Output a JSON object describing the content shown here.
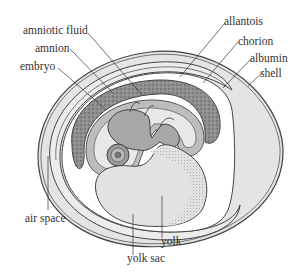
{
  "diagram": {
    "labels": {
      "amniotic_fluid": "amniotic fluid",
      "amnion": "amnion",
      "embryo": "embryo",
      "allantois": "allantois",
      "chorion": "chorion",
      "albumin": "albumin",
      "shell": "shell",
      "air_space": "air space",
      "yolk": "yolk",
      "yolk_sac": "yolk sac"
    },
    "colors": {
      "outline": "#444444",
      "albumin_fill": "#e4e4e4",
      "chorion_fill": "#e9e9e9",
      "allantois_fill": "#8e8e8e",
      "amnion_fill": "#bdbdbd",
      "embryo_fill": "#a8a8a8",
      "yolk_fill": "#e2e2e2",
      "text": "#333333"
    }
  }
}
